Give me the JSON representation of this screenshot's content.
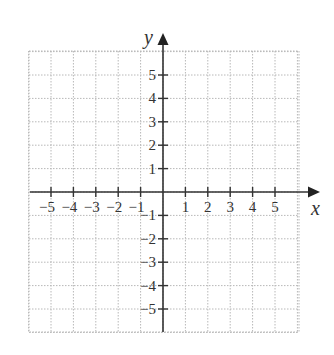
{
  "chart_data": {
    "type": "coordinate-grid",
    "title": "",
    "xlabel": "x",
    "ylabel": "y",
    "xlim": [
      -6,
      6
    ],
    "ylim": [
      -6,
      6
    ],
    "grid": true,
    "grid_style": "dotted",
    "x_ticks": [
      -5,
      -4,
      -3,
      -2,
      -1,
      1,
      2,
      3,
      4,
      5
    ],
    "y_ticks": [
      5,
      4,
      3,
      2,
      1,
      -1,
      -2,
      -3,
      -4,
      -5
    ],
    "x_tick_labels": [
      "−5",
      "−4",
      "−3",
      "−2",
      "−1",
      "1",
      "2",
      "3",
      "4",
      "5"
    ],
    "y_tick_labels": [
      "5",
      "4",
      "3",
      "2",
      "1",
      "−1",
      "−2",
      "−3",
      "−4",
      "−5"
    ],
    "points": []
  },
  "colors": {
    "axis": "#333333",
    "grid": "#b8b8b8",
    "background": "#ffffff"
  },
  "axes": {
    "x_label": "x",
    "y_label": "y"
  }
}
